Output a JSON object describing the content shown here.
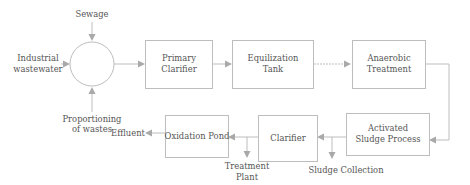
{
  "diagram": {
    "type": "process-flow",
    "colors": {
      "stroke": "#bdbdbd",
      "arrow": "#a9a9a9",
      "text": "#555555",
      "background": "#ffffff"
    },
    "inputs": {
      "sewage": "Sewage",
      "industrial_line1": "Industrial",
      "industrial_line2": "wastewater",
      "proportioning_line1": "Proportioning",
      "proportioning_line2": "of wastes"
    },
    "nodes": {
      "mixing": {
        "shape": "circle",
        "label": ""
      },
      "primary_clarifier": {
        "line1": "Primary",
        "line2": "Clarifier"
      },
      "equalization_tank": {
        "line1": "Equilization",
        "line2": "Tank"
      },
      "anaerobic_treatment": {
        "line1": "Anaerobic",
        "line2": "Treatment"
      },
      "activated_sludge": {
        "line1": "Activated",
        "line2": "Sludge Process"
      },
      "clarifier": {
        "line1": "Clarifier"
      },
      "oxidation_pond": {
        "line1": "Oxidation Pond"
      }
    },
    "outputs": {
      "effluent": "Effluent",
      "treatment_line1": "Treatment",
      "treatment_line2": "Plant",
      "sludge_collection": "Sludge Collection"
    },
    "edges": [
      [
        "Sewage",
        "mixing"
      ],
      [
        "Industrial wastewater",
        "mixing"
      ],
      [
        "Proportioning of wastes",
        "mixing"
      ],
      [
        "mixing",
        "Primary Clarifier"
      ],
      [
        "Primary Clarifier",
        "Equilization Tank"
      ],
      [
        "Equilization Tank",
        "Anaerobic Treatment"
      ],
      [
        "Anaerobic Treatment",
        "Activated Sludge Process"
      ],
      [
        "Activated Sludge Process",
        "Clarifier"
      ],
      [
        "Activated Sludge Process",
        "Sludge Collection"
      ],
      [
        "Clarifier",
        "Oxidation Pond"
      ],
      [
        "Clarifier",
        "Treatment Plant"
      ],
      [
        "Oxidation Pond",
        "Effluent"
      ]
    ]
  }
}
